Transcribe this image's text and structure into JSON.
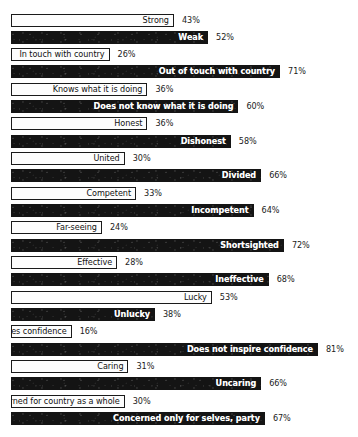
{
  "chart_data": {
    "type": "bar",
    "title": "",
    "subtitle": "",
    "xlabel": "",
    "ylabel": "",
    "xlim": [
      0,
      100
    ],
    "grid": false,
    "legend": null,
    "orientation": "horizontal",
    "value_suffix": "%",
    "categories": [
      "Strong",
      "Weak",
      "In touch with country",
      "Out of touch with country",
      "Knows what it is doing",
      "Does not know what it is doing",
      "Honest",
      "Dishonest",
      "United",
      "Divided",
      "Competent",
      "Incompetent",
      "Far-seeing",
      "Shortsighted",
      "Effective",
      "Ineffective",
      "Lucky",
      "Unlucky",
      "Inspires confidence",
      "Does not inspire confidence",
      "Caring",
      "Uncaring",
      "Concerned for country as a whole",
      "Concerned only for selves, party"
    ],
    "values": [
      43,
      52,
      26,
      71,
      36,
      60,
      36,
      58,
      30,
      66,
      33,
      64,
      24,
      72,
      28,
      68,
      53,
      38,
      16,
      81,
      31,
      66,
      30,
      67
    ],
    "value_labels": [
      "43%",
      "52%",
      "26%",
      "71%",
      "36%",
      "60%",
      "36%",
      "58%",
      "30%",
      "66%",
      "33%",
      "64%",
      "24%",
      "72%",
      "28%",
      "68%",
      "53%",
      "38%",
      "16%",
      "81%",
      "31%",
      "66%",
      "30%",
      "67%"
    ],
    "styles": [
      "light",
      "dark",
      "light",
      "dark",
      "light",
      "dark",
      "light",
      "dark",
      "light",
      "dark",
      "light",
      "dark",
      "light",
      "dark",
      "light",
      "dark",
      "light",
      "dark",
      "light",
      "dark",
      "light",
      "dark",
      "light",
      "dark"
    ],
    "colors": {
      "light_fill": "#fdfdfd",
      "light_border": "#1a1a1a",
      "light_text": "#111111",
      "dark_fill": "#141414",
      "dark_text": "#ffffff",
      "value_text": "#1a1a1a",
      "background": "#ffffff"
    }
  }
}
